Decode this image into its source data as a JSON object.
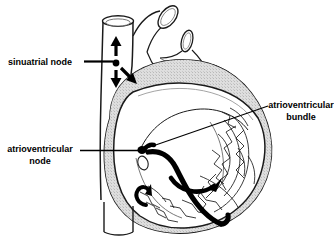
{
  "figure": {
    "background_color": "#ffffff",
    "ink_color": "#000000",
    "myocardium_fill": "#d9d9d9",
    "chamber_fill": "#ffffff",
    "width": 334,
    "height": 246
  },
  "labels": {
    "sinuatrial_node": {
      "line1": "sinuatrial node",
      "line2": ""
    },
    "atrioventricular_node": {
      "line1": "atrioventricular",
      "line2": "node"
    },
    "atrioventricular_bundle": {
      "line1": "atrioventricular",
      "line2": "bundle"
    }
  },
  "structures": {
    "superior_vena_cava": "superior-vena-cava",
    "aortic_arch": "aortic-arch",
    "pulmonary_vessel": "pulmonary-vessel-stump",
    "inferior_vena_cava": "inferior-vena-cava",
    "ventricular_wall": "ventricular-myocardium",
    "trabeculae": "trabeculae-carneae",
    "coronary_sinus_opening": "coronary-sinus-opening",
    "sa_node_marker": "sinuatrial-node-marker",
    "av_node_marker": "atrioventricular-node-marker",
    "av_bundle_path": "atrioventricular-bundle-path",
    "left_bundle_branch": "left-bundle-branch-arrow",
    "right_bundle_branch": "right-bundle-branch-arrow"
  }
}
